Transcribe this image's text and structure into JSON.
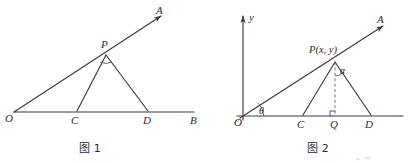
{
  "document": {
    "kind": "geometry-diagram-pair",
    "background_color": "#ffffff",
    "ink_color": "#3a3a3a"
  },
  "figure1": {
    "caption": "图 1",
    "labels": {
      "origin": "O",
      "ray_end": "A",
      "apex": "P",
      "base_left": "C",
      "base_right": "D",
      "base_end": "B"
    },
    "geometry": {
      "O": [
        14,
        112
      ],
      "A": [
        164,
        14
      ],
      "B": [
        196,
        112
      ],
      "P": [
        106,
        53
      ],
      "C": [
        77,
        112
      ],
      "D": [
        148,
        112
      ]
    },
    "segments": [
      {
        "name": "ray-OA",
        "from": "O",
        "to": "A"
      },
      {
        "name": "ray-OB",
        "from": "O",
        "to": "B"
      },
      {
        "name": "segment-PC",
        "from": "P",
        "to": "C"
      },
      {
        "name": "segment-PD",
        "from": "P",
        "to": "D"
      }
    ]
  },
  "figure2": {
    "caption": "图 2",
    "labels": {
      "origin": "O",
      "y_axis": "y",
      "ray_end": "A",
      "apex": "P(x, y)",
      "base_left": "C",
      "foot": "Q",
      "base_right": "D",
      "angle_at_origin": "θ",
      "angle_at_apex": "α"
    },
    "geometry": {
      "O": [
        243,
        116
      ],
      "A": [
        385,
        24
      ],
      "y_axis_top": [
        243,
        14
      ],
      "x_axis_right": [
        403,
        116
      ],
      "P": [
        335,
        60
      ],
      "C": [
        303,
        116
      ],
      "Q": [
        335,
        116
      ],
      "D": [
        371,
        116
      ]
    },
    "segments": [
      {
        "name": "ray-OA",
        "from": "O",
        "to": "A"
      },
      {
        "name": "x-axis",
        "from": "O",
        "to": "x_axis_right"
      },
      {
        "name": "y-axis",
        "from": "O",
        "to": "y_axis_top"
      },
      {
        "name": "segment-PC",
        "from": "P",
        "to": "C"
      },
      {
        "name": "segment-PD",
        "from": "P",
        "to": "D"
      },
      {
        "name": "segment-PQ-dashed",
        "from": "P",
        "to": "Q",
        "style": "dashed"
      }
    ],
    "marks": [
      {
        "name": "right-angle-at-Q",
        "type": "square"
      },
      {
        "name": "angle-arc-theta",
        "type": "arc"
      },
      {
        "name": "angle-arc-alpha",
        "type": "arc"
      }
    ]
  }
}
